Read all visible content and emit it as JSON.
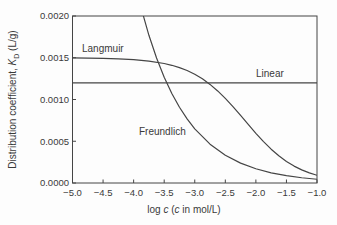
{
  "figure": {
    "background": "#fdfdfd",
    "line_color": "#454545",
    "text_color": "#3a3a3a"
  },
  "chart_data": {
    "type": "line",
    "title": "",
    "xlabel": "log c (c in mol/L)",
    "xlabel_parts": {
      "p1": "log ",
      "c1": "c",
      "p2": " (",
      "c2": "c",
      "p3": " in mol/L)"
    },
    "ylabel": "Distribution coefficient, K_D (L/g)",
    "ylabel_parts": {
      "p1": "Distribution coefficient, ",
      "k": "K",
      "ksub": "D",
      "p2": " (L/g)"
    },
    "xlim": [
      -5.0,
      -1.0
    ],
    "ylim": [
      0.0,
      0.002
    ],
    "grid": false,
    "legend": "inline-annotations",
    "x_ticks": [
      -5.0,
      -4.5,
      -4.0,
      -3.5,
      -3.0,
      -2.5,
      -2.0,
      -1.5,
      -1.0
    ],
    "x_tick_labels": [
      "−5.0",
      "−4.5",
      "−4.0",
      "−3.5",
      "−3.0",
      "−2.5",
      "−2.0",
      "−1.5",
      "−1.0"
    ],
    "y_ticks": [
      0.0,
      0.0005,
      0.001,
      0.0015,
      0.002
    ],
    "y_tick_labels": [
      "0.0000",
      "0.0005",
      "0.0010",
      "0.0015",
      "0.0020"
    ],
    "series": [
      {
        "name": "Langmuir",
        "x": [
          -5.0,
          -4.75,
          -4.5,
          -4.25,
          -4.0,
          -3.75,
          -3.5,
          -3.375,
          -3.25,
          -3.125,
          -3.0,
          -2.875,
          -2.75,
          -2.625,
          -2.5,
          -2.375,
          -2.25,
          -2.125,
          -2.0,
          -1.875,
          -1.75,
          -1.625,
          -1.5,
          -1.375,
          -1.25,
          -1.125,
          -1.0
        ],
        "y": [
          0.0014977,
          0.001496,
          0.0014928,
          0.0014873,
          0.0014775,
          0.0014605,
          0.0014312,
          0.0014096,
          0.0013819,
          0.0013467,
          0.0013021,
          0.0012472,
          0.0011808,
          0.0011026,
          0.001013,
          0.0009141,
          0.0008086,
          0.000701,
          0.0005952,
          0.0004956,
          0.000405,
          0.0003257,
          0.0002583,
          0.0002024,
          0.0001571,
          0.000121,
          9.26e-05
        ]
      },
      {
        "name": "Linear",
        "x": [
          -5.0,
          -1.0
        ],
        "y": [
          0.0012,
          0.0012
        ]
      },
      {
        "name": "Freundlich",
        "x": [
          -4.0,
          -3.875,
          -3.75,
          -3.625,
          -3.5,
          -3.375,
          -3.25,
          -3.125,
          -3.0,
          -2.75,
          -2.5,
          -2.25,
          -2.0,
          -1.75,
          -1.5,
          -1.25,
          -1.0
        ],
        "y": [
          0.00247,
          0.00209,
          0.001769,
          0.001497,
          0.001267,
          0.001072,
          0.000907,
          0.000768,
          0.000649,
          0.000465,
          0.000333,
          0.000238,
          0.000171,
          0.000122,
          8.75e-05,
          6.27e-05,
          4.49e-05
        ]
      }
    ]
  }
}
